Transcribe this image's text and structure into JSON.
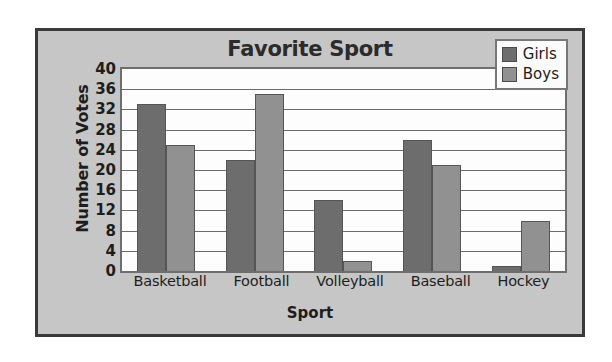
{
  "chart_data": {
    "type": "bar",
    "title": "Favorite Sport",
    "xlabel": "Sport",
    "ylabel": "Number of Votes",
    "categories": [
      "Basketball",
      "Football",
      "Volleyball",
      "Baseball",
      "Hockey"
    ],
    "series": [
      {
        "name": "Girls",
        "color": "#6d6d6d",
        "values": [
          33,
          22,
          14,
          26,
          1
        ]
      },
      {
        "name": "Boys",
        "color": "#919191",
        "values": [
          25,
          35,
          2,
          21,
          10
        ]
      }
    ],
    "ylim": [
      0,
      40
    ],
    "yticks": [
      0,
      4,
      8,
      12,
      16,
      20,
      24,
      28,
      32,
      36,
      40
    ],
    "ytick_labels": [
      "0",
      "4",
      "8",
      "12",
      "16",
      "20",
      "24",
      "28",
      "32",
      "36",
      "40"
    ],
    "grid": true,
    "grid_axis": "y",
    "legend_position": "top-right",
    "plot_background": "#fdfdfd",
    "panel_background": "#c6c6c6",
    "border_color": "#3a3a3a"
  },
  "legend": {
    "entries": [
      {
        "label": "Girls"
      },
      {
        "label": "Boys"
      }
    ]
  }
}
